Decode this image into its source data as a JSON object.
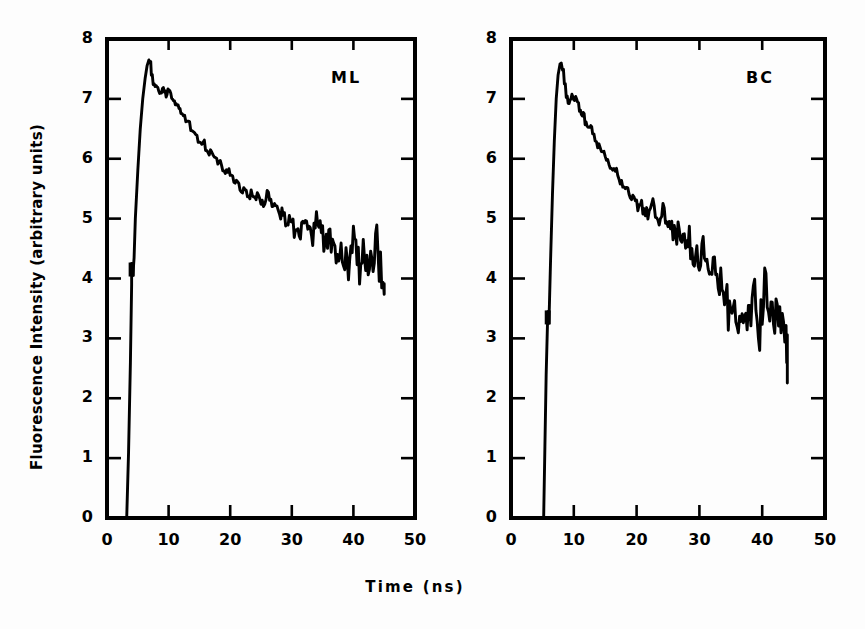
{
  "figure": {
    "background_color": "#fdfdfd",
    "ink_color": "#000000",
    "axis_title_y": "Fluorescence Intensity (arbitrary units)",
    "axis_title_x": "Time (ns)"
  },
  "chart_data": {
    "type": "line",
    "title": "",
    "xlabel": "Time (ns)",
    "ylabel": "Fluorescence Intensity (arbitrary units)",
    "xlim": [
      0,
      50
    ],
    "ylim": [
      0,
      8
    ],
    "xticks": [
      0,
      10,
      20,
      30,
      40,
      50
    ],
    "yticks": [
      0,
      1,
      2,
      3,
      4,
      5,
      6,
      7,
      8
    ],
    "xtick_labels": [
      "0",
      "10",
      "20",
      "30",
      "40",
      "50"
    ],
    "ytick_labels": [
      "0",
      "1",
      "2",
      "3",
      "4",
      "5",
      "6",
      "7",
      "8"
    ],
    "grid": false,
    "legend": "none",
    "tick_direction": "in",
    "panels": [
      {
        "id": "ML",
        "label": "ML",
        "label_position": "top-right",
        "description": "Fluorescence decay curve, monolayer sample",
        "rise_start_ns": 3.2,
        "peak_ns": 7.0,
        "peak_value": 7.65,
        "end_ns": 45.0,
        "end_value": 3.5,
        "x": [
          3.2,
          3.5,
          3.8,
          4.0,
          4.0,
          4.2,
          4.4,
          4.6,
          5.0,
          5.4,
          5.8,
          6.2,
          6.5,
          6.8,
          7.0,
          7.2,
          7.5,
          7.8,
          8.1,
          8.4,
          8.7,
          9.0,
          9.3,
          9.6,
          9.9,
          10.2,
          10.5,
          10.8,
          11.1,
          11.4,
          11.7,
          12.0,
          12.4,
          12.8,
          13.2,
          13.6,
          14.0,
          14.4,
          14.8,
          15.2,
          15.6,
          16.0,
          16.4,
          16.8,
          17.2,
          17.6,
          18.0,
          18.4,
          18.8,
          19.2,
          19.6,
          20.0,
          20.4,
          20.8,
          21.2,
          21.6,
          22.0,
          22.4,
          22.8,
          23.2,
          23.6,
          24.0,
          24.4,
          24.8,
          25.2,
          25.6,
          26.0,
          26.4,
          26.8,
          27.2,
          27.6,
          28.0,
          28.4,
          28.8,
          29.2,
          29.6,
          30.0,
          30.4,
          30.8,
          31.2,
          31.6,
          32.0,
          32.4,
          32.8,
          33.2,
          33.6,
          34.0,
          34.4,
          34.8,
          35.2,
          35.6,
          36.0,
          36.4,
          36.8,
          37.2,
          37.6,
          38.0,
          38.4,
          38.8,
          39.2,
          39.6,
          40.0,
          40.4,
          40.8,
          41.2,
          41.6,
          42.0,
          42.4,
          42.8,
          43.2,
          43.6,
          44.0,
          44.4,
          44.8,
          45.0
        ],
        "y": [
          0.0,
          1.1,
          2.6,
          3.9,
          4.25,
          4.05,
          4.35,
          5.0,
          5.8,
          6.5,
          7.0,
          7.35,
          7.55,
          7.65,
          7.62,
          7.4,
          7.25,
          7.2,
          7.18,
          7.12,
          7.1,
          7.2,
          7.12,
          7.05,
          7.15,
          7.12,
          7.0,
          6.95,
          6.9,
          6.92,
          6.82,
          6.75,
          6.72,
          6.62,
          6.6,
          6.5,
          6.45,
          6.42,
          6.3,
          6.25,
          6.28,
          6.18,
          6.1,
          6.12,
          6.05,
          5.98,
          5.95,
          5.92,
          5.82,
          5.78,
          5.82,
          5.7,
          5.65,
          5.6,
          5.55,
          5.5,
          5.48,
          5.42,
          5.35,
          5.4,
          5.3,
          5.28,
          5.45,
          5.3,
          5.22,
          5.3,
          5.42,
          5.3,
          5.2,
          5.18,
          5.25,
          5.1,
          5.05,
          5.0,
          4.95,
          4.98,
          4.85,
          4.8,
          4.72,
          4.78,
          4.85,
          4.95,
          4.82,
          4.72,
          4.65,
          4.8,
          4.95,
          4.85,
          4.7,
          4.62,
          4.58,
          4.68,
          4.55,
          4.5,
          4.45,
          4.55,
          4.38,
          4.3,
          4.45,
          4.25,
          4.42,
          4.6,
          4.45,
          4.2,
          4.35,
          4.5,
          4.3,
          4.1,
          4.2,
          4.45,
          4.6,
          4.35,
          4.1,
          3.85,
          3.95,
          3.8,
          3.55,
          3.48
        ]
      },
      {
        "id": "BC",
        "label": "BC",
        "label_position": "top-right",
        "description": "Fluorescence decay curve, bulk crystal sample",
        "rise_start_ns": 5.2,
        "peak_ns": 8.0,
        "peak_value": 7.6,
        "end_ns": 44.0,
        "end_value": 2.7,
        "x": [
          5.2,
          5.4,
          5.6,
          5.8,
          5.9,
          6.0,
          6.1,
          6.3,
          6.6,
          6.9,
          7.2,
          7.5,
          7.8,
          8.0,
          8.2,
          8.5,
          8.8,
          9.1,
          9.4,
          9.7,
          10.0,
          10.3,
          10.6,
          10.9,
          11.2,
          11.5,
          11.8,
          12.1,
          12.4,
          12.7,
          13.0,
          13.4,
          13.8,
          14.2,
          14.6,
          15.0,
          15.4,
          15.8,
          16.2,
          16.6,
          17.0,
          17.4,
          17.8,
          18.2,
          18.6,
          19.0,
          19.4,
          19.8,
          20.2,
          20.6,
          21.0,
          21.4,
          21.8,
          22.2,
          22.6,
          23.0,
          23.4,
          23.8,
          24.2,
          24.6,
          25.0,
          25.4,
          25.8,
          26.2,
          26.6,
          27.0,
          27.4,
          27.8,
          28.2,
          28.6,
          29.0,
          29.4,
          29.8,
          30.2,
          30.6,
          31.0,
          31.4,
          31.8,
          32.2,
          32.6,
          33.0,
          33.4,
          33.8,
          34.2,
          34.6,
          35.0,
          35.4,
          35.8,
          36.2,
          36.6,
          37.0,
          37.4,
          37.8,
          38.2,
          38.6,
          39.0,
          39.4,
          39.8,
          40.2,
          40.6,
          41.0,
          41.4,
          41.8,
          42.2,
          42.6,
          43.0,
          43.4,
          43.8,
          44.0
        ],
        "y": [
          0.0,
          1.2,
          2.4,
          3.2,
          3.45,
          3.25,
          3.5,
          4.3,
          5.4,
          6.3,
          7.0,
          7.4,
          7.58,
          7.6,
          7.5,
          7.25,
          7.05,
          6.95,
          7.0,
          7.05,
          6.98,
          7.02,
          6.95,
          6.8,
          6.72,
          6.75,
          6.6,
          6.55,
          6.5,
          6.52,
          6.4,
          6.3,
          6.22,
          6.15,
          6.1,
          6.0,
          5.95,
          5.88,
          5.8,
          5.82,
          5.7,
          5.62,
          5.58,
          5.5,
          5.45,
          5.38,
          5.35,
          5.28,
          5.2,
          5.3,
          5.15,
          5.1,
          5.05,
          5.15,
          5.25,
          5.1,
          4.95,
          5.05,
          5.2,
          5.0,
          4.85,
          4.9,
          4.78,
          4.7,
          4.85,
          4.75,
          4.6,
          4.55,
          4.7,
          4.5,
          4.35,
          4.45,
          4.3,
          4.4,
          4.55,
          4.35,
          4.1,
          4.3,
          4.45,
          4.2,
          3.95,
          4.1,
          3.85,
          3.6,
          3.4,
          3.55,
          3.75,
          3.5,
          3.3,
          3.45,
          3.6,
          3.35,
          3.15,
          3.35,
          3.6,
          3.4,
          3.2,
          3.45,
          3.8,
          3.95,
          3.7,
          3.45,
          3.6,
          3.8,
          3.5,
          3.2,
          2.95,
          2.8,
          2.72
        ]
      }
    ]
  },
  "panel_left": {
    "label": "ML",
    "xtick_labels": [
      "0",
      "10",
      "20",
      "30",
      "40",
      "50"
    ],
    "ytick_labels": [
      "0",
      "1",
      "2",
      "3",
      "4",
      "5",
      "6",
      "7",
      "8"
    ]
  },
  "panel_right": {
    "label": "BC",
    "xtick_labels": [
      "0",
      "10",
      "20",
      "30",
      "40",
      "50"
    ],
    "ytick_labels": [
      "0",
      "1",
      "2",
      "3",
      "4",
      "5",
      "6",
      "7",
      "8"
    ]
  }
}
